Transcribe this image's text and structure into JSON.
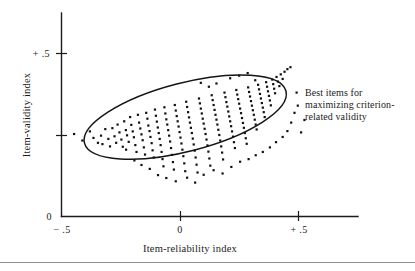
{
  "chart_data": {
    "type": "scatter",
    "title": "",
    "xlabel": "Item-reliability index",
    "ylabel": "Item-validity index",
    "xlim": [
      -0.5,
      0.65
    ],
    "ylim": [
      0.0,
      0.58
    ],
    "grid": false,
    "legend_position": "none",
    "x_ticks": [
      {
        "value": -0.5,
        "label": "− .5"
      },
      {
        "value": 0.0,
        "label": "0"
      },
      {
        "value": 0.5,
        "label": "+ .5"
      }
    ],
    "y_ticks": [
      {
        "value": 0.0,
        "label": "0"
      },
      {
        "value": 0.25,
        "label": ""
      },
      {
        "value": 0.5,
        "label": "+ .5"
      }
    ],
    "annotations": [
      {
        "name": "best-items-callout",
        "lines": [
          "Best items for",
          "maximizing criterion-",
          "related validity"
        ],
        "x": 0.55,
        "y": 0.4
      }
    ],
    "shapes": [
      {
        "name": "selection-ellipse",
        "type": "ellipse",
        "center_x": 0.02,
        "center_y": 0.305,
        "semi_major": 0.44,
        "semi_minor": 0.105,
        "rotation_deg": -14.5
      }
    ],
    "points": [
      [
        -0.45,
        0.253
      ],
      [
        -0.415,
        0.233
      ],
      [
        -0.383,
        0.261
      ],
      [
        -0.368,
        0.241
      ],
      [
        -0.349,
        0.226
      ],
      [
        -0.336,
        0.248
      ],
      [
        -0.33,
        0.222
      ],
      [
        -0.318,
        0.268
      ],
      [
        -0.305,
        0.238
      ],
      [
        -0.298,
        0.215
      ],
      [
        -0.288,
        0.271
      ],
      [
        -0.279,
        0.246
      ],
      [
        -0.272,
        0.226
      ],
      [
        -0.266,
        0.282
      ],
      [
        -0.258,
        0.258
      ],
      [
        -0.25,
        0.236
      ],
      [
        -0.244,
        0.214
      ],
      [
        -0.238,
        0.292
      ],
      [
        -0.231,
        0.265
      ],
      [
        -0.226,
        0.249
      ],
      [
        -0.219,
        0.229
      ],
      [
        -0.213,
        0.305
      ],
      [
        -0.208,
        0.281
      ],
      [
        -0.202,
        0.261
      ],
      [
        -0.197,
        0.243
      ],
      [
        -0.191,
        0.219
      ],
      [
        -0.186,
        0.198
      ],
      [
        -0.18,
        0.312
      ],
      [
        -0.175,
        0.288
      ],
      [
        -0.17,
        0.27
      ],
      [
        -0.165,
        0.252
      ],
      [
        -0.16,
        0.234
      ],
      [
        -0.155,
        0.212
      ],
      [
        -0.15,
        0.19
      ],
      [
        -0.145,
        0.318
      ],
      [
        -0.14,
        0.3
      ],
      [
        -0.136,
        0.279
      ],
      [
        -0.131,
        0.262
      ],
      [
        -0.127,
        0.244
      ],
      [
        -0.122,
        0.225
      ],
      [
        -0.118,
        0.203
      ],
      [
        -0.113,
        0.181
      ],
      [
        -0.108,
        0.328
      ],
      [
        -0.104,
        0.309
      ],
      [
        -0.1,
        0.291
      ],
      [
        -0.096,
        0.273
      ],
      [
        -0.092,
        0.256
      ],
      [
        -0.088,
        0.238
      ],
      [
        -0.084,
        0.219
      ],
      [
        -0.08,
        0.198
      ],
      [
        -0.076,
        0.176
      ],
      [
        -0.072,
        0.154
      ],
      [
        -0.068,
        0.335
      ],
      [
        -0.064,
        0.316
      ],
      [
        -0.06,
        0.298
      ],
      [
        -0.056,
        0.282
      ],
      [
        -0.052,
        0.265
      ],
      [
        -0.048,
        0.248
      ],
      [
        -0.044,
        0.23
      ],
      [
        -0.04,
        0.21
      ],
      [
        -0.036,
        0.189
      ],
      [
        -0.032,
        0.167
      ],
      [
        -0.028,
        0.144
      ],
      [
        -0.024,
        0.342
      ],
      [
        -0.02,
        0.325
      ],
      [
        -0.016,
        0.308
      ],
      [
        -0.012,
        0.292
      ],
      [
        -0.008,
        0.276
      ],
      [
        -0.004,
        0.259
      ],
      [
        0.0,
        0.242
      ],
      [
        0.004,
        0.224
      ],
      [
        0.008,
        0.205
      ],
      [
        0.012,
        0.185
      ],
      [
        0.016,
        0.163
      ],
      [
        0.02,
        0.139
      ],
      [
        0.024,
        0.352
      ],
      [
        0.028,
        0.336
      ],
      [
        0.032,
        0.32
      ],
      [
        0.036,
        0.304
      ],
      [
        0.04,
        0.288
      ],
      [
        0.044,
        0.272
      ],
      [
        0.048,
        0.256
      ],
      [
        0.052,
        0.239
      ],
      [
        0.056,
        0.221
      ],
      [
        0.06,
        0.202
      ],
      [
        0.064,
        0.181
      ],
      [
        0.068,
        0.159
      ],
      [
        0.072,
        0.135
      ],
      [
        0.078,
        0.362
      ],
      [
        0.082,
        0.347
      ],
      [
        0.086,
        0.331
      ],
      [
        0.09,
        0.316
      ],
      [
        0.094,
        0.3
      ],
      [
        0.098,
        0.285
      ],
      [
        0.102,
        0.269
      ],
      [
        0.106,
        0.253
      ],
      [
        0.11,
        0.236
      ],
      [
        0.114,
        0.218
      ],
      [
        0.118,
        0.199
      ],
      [
        0.122,
        0.178
      ],
      [
        0.126,
        0.156
      ],
      [
        0.132,
        0.372
      ],
      [
        0.136,
        0.357
      ],
      [
        0.14,
        0.342
      ],
      [
        0.144,
        0.327
      ],
      [
        0.148,
        0.312
      ],
      [
        0.152,
        0.297
      ],
      [
        0.156,
        0.282
      ],
      [
        0.16,
        0.266
      ],
      [
        0.164,
        0.25
      ],
      [
        0.168,
        0.233
      ],
      [
        0.172,
        0.215
      ],
      [
        0.176,
        0.196
      ],
      [
        0.18,
        0.175
      ],
      [
        0.186,
        0.38
      ],
      [
        0.19,
        0.366
      ],
      [
        0.194,
        0.351
      ],
      [
        0.198,
        0.337
      ],
      [
        0.202,
        0.322
      ],
      [
        0.206,
        0.307
      ],
      [
        0.21,
        0.292
      ],
      [
        0.214,
        0.277
      ],
      [
        0.218,
        0.261
      ],
      [
        0.222,
        0.245
      ],
      [
        0.226,
        0.228
      ],
      [
        0.23,
        0.21
      ],
      [
        0.236,
        0.388
      ],
      [
        0.24,
        0.374
      ],
      [
        0.244,
        0.36
      ],
      [
        0.248,
        0.346
      ],
      [
        0.252,
        0.331
      ],
      [
        0.256,
        0.317
      ],
      [
        0.26,
        0.302
      ],
      [
        0.264,
        0.287
      ],
      [
        0.268,
        0.272
      ],
      [
        0.272,
        0.256
      ],
      [
        0.276,
        0.24
      ],
      [
        0.28,
        0.223
      ],
      [
        0.286,
        0.396
      ],
      [
        0.29,
        0.382
      ],
      [
        0.294,
        0.368
      ],
      [
        0.298,
        0.354
      ],
      [
        0.302,
        0.34
      ],
      [
        0.306,
        0.326
      ],
      [
        0.31,
        0.312
      ],
      [
        0.314,
        0.297
      ],
      [
        0.318,
        0.282
      ],
      [
        0.322,
        0.267
      ],
      [
        0.328,
        0.404
      ],
      [
        0.332,
        0.39
      ],
      [
        0.336,
        0.376
      ],
      [
        0.34,
        0.362
      ],
      [
        0.344,
        0.348
      ],
      [
        0.348,
        0.334
      ],
      [
        0.352,
        0.32
      ],
      [
        0.356,
        0.305
      ],
      [
        0.362,
        0.412
      ],
      [
        0.366,
        0.398
      ],
      [
        0.37,
        0.384
      ],
      [
        0.374,
        0.37
      ],
      [
        0.378,
        0.356
      ],
      [
        0.382,
        0.341
      ],
      [
        0.388,
        0.42
      ],
      [
        0.392,
        0.406
      ],
      [
        0.396,
        0.392
      ],
      [
        0.4,
        0.378
      ],
      [
        0.406,
        0.428
      ],
      [
        0.412,
        0.414
      ],
      [
        0.418,
        0.4
      ],
      [
        0.424,
        0.436
      ],
      [
        0.432,
        0.422
      ],
      [
        0.44,
        0.444
      ],
      [
        0.452,
        0.452
      ],
      [
        0.465,
        0.458
      ],
      [
        -0.23,
        0.205
      ],
      [
        -0.195,
        0.172
      ],
      [
        -0.165,
        0.158
      ],
      [
        -0.13,
        0.146
      ],
      [
        -0.095,
        0.127
      ],
      [
        -0.06,
        0.118
      ],
      [
        -0.02,
        0.108
      ],
      [
        0.028,
        0.119
      ],
      [
        0.062,
        0.104
      ],
      [
        0.098,
        0.128
      ],
      [
        0.14,
        0.142
      ],
      [
        0.178,
        0.132
      ],
      [
        0.215,
        0.152
      ],
      [
        0.252,
        0.168
      ],
      [
        0.288,
        0.176
      ],
      [
        0.318,
        0.188
      ],
      [
        0.348,
        0.198
      ],
      [
        0.378,
        0.212
      ],
      [
        0.404,
        0.228
      ],
      [
        0.432,
        0.244
      ],
      [
        0.452,
        0.262
      ],
      [
        0.468,
        0.288
      ],
      [
        0.482,
        0.318
      ],
      [
        0.496,
        0.34
      ],
      [
        0.51,
        0.258
      ],
      [
        0.524,
        0.296
      ],
      [
        0.21,
        0.424
      ],
      [
        0.248,
        0.432
      ],
      [
        0.284,
        0.44
      ],
      [
        0.316,
        0.418
      ],
      [
        0.152,
        0.408
      ],
      [
        0.12,
        0.398
      ],
      [
        0.086,
        0.41
      ]
    ]
  },
  "figure": {
    "background_color": "#ffffff",
    "ink_color": "#141414",
    "has_footer_rule": true
  }
}
